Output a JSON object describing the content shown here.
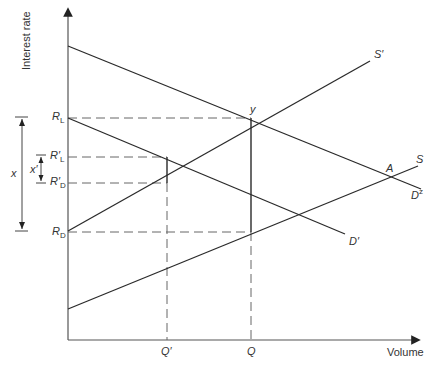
{
  "axes": {
    "y_label": "Interest rate",
    "x_label": "Volume"
  },
  "rate_levels": {
    "R_L": {
      "base": "R",
      "sub": "L",
      "prime": ""
    },
    "R_prime_L": {
      "base": "R",
      "sub": "L",
      "prime": "′"
    },
    "R_prime_D": {
      "base": "R",
      "sub": "D",
      "prime": "′"
    },
    "R_D": {
      "base": "R",
      "sub": "D",
      "prime": ""
    }
  },
  "quantities": {
    "Q_prime": "Q′",
    "Q": "Q"
  },
  "spreads": {
    "x": "x",
    "x_prime": "x′"
  },
  "curves": {
    "S_prime": "S′",
    "S": "S",
    "D_prime": "D′",
    "D_z": {
      "base": "D",
      "sup": "z"
    }
  },
  "points": {
    "y": "y",
    "A": "A"
  },
  "colors": {
    "line": "#2a2a2a",
    "axis": "#555555",
    "dash": "#666666",
    "text": "#333333"
  }
}
